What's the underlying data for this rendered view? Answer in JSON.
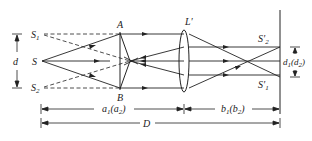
{
  "diagram": {
    "type": "optics-biprism-interference",
    "labels": {
      "source": "S",
      "virtual_source_1": "S",
      "virtual_source_1_sub": "1",
      "virtual_source_2": "S",
      "virtual_source_2_sub": "2",
      "prism_top": "A",
      "prism_bottom": "B",
      "lens": "L′",
      "image_1": "S′",
      "image_1_sub": "1",
      "image_2": "S′",
      "image_2_sub": "2",
      "separation": "d",
      "image_separation": "d",
      "image_separation_sub": "1",
      "image_separation_paren": "(d",
      "image_separation_paren_sub": "2",
      "image_separation_close": ")",
      "object_distance": "a",
      "object_distance_sub": "1",
      "object_distance_paren": "(a",
      "object_distance_paren_sub": "2",
      "object_distance_close": ")",
      "image_distance": "b",
      "image_distance_sub": "1",
      "image_distance_paren": "(b",
      "image_distance_paren_sub": "2",
      "image_distance_close": ")",
      "total_distance": "D"
    },
    "colors": {
      "line": "#222222",
      "background": "#ffffff"
    }
  }
}
